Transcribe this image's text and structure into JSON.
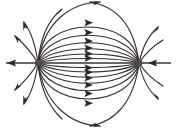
{
  "figure": {
    "background_color": "#ffffff",
    "line_color": "#332f2e",
    "arrow_color": "#2b2827",
    "pole_color": "#504a48",
    "canvas": {
      "width": 176,
      "height": 128
    }
  },
  "poles": [
    {
      "name": "left-pole",
      "label": "",
      "x": 38,
      "y": 63,
      "radius": 3.2
    },
    {
      "name": "right-pole",
      "label": "",
      "x": 139,
      "y": 63,
      "radius": 3.4
    }
  ],
  "axis": {
    "name": "horizontal-axis",
    "y": 63,
    "left_end": 6,
    "right_end": 171,
    "left_arrow_direction": "left",
    "left_arrow_x": 13,
    "right_arrow_direction": "left",
    "right_arrow_x": 148
  },
  "chart_data": {
    "type": "line",
    "xlabel": "",
    "ylabel": "",
    "xlim": [
      0,
      176
    ],
    "ylim": [
      0,
      128
    ],
    "grid": false,
    "legend": "none",
    "series": [
      {
        "name": "inner-loop-1",
        "half_height": 3,
        "arrow_direction": "right",
        "arrow_y": 60
      },
      {
        "name": "inner-loop-2",
        "half_height": 8,
        "arrow_direction": "right",
        "arrow_y": 55
      },
      {
        "name": "inner-loop-3",
        "half_height": 14,
        "arrow_direction": "right",
        "arrow_y": 49
      },
      {
        "name": "inner-loop-4",
        "half_height": 21,
        "arrow_direction": "right",
        "arrow_y": 42
      },
      {
        "name": "inner-loop-5",
        "half_height": 29,
        "arrow_direction": "right",
        "arrow_y": 34
      },
      {
        "name": "inner-loop-6",
        "half_height": 38,
        "arrow_direction": "right",
        "arrow_y": 25
      },
      {
        "name": "outer-escape-upper-left",
        "arrow_direction": "up-right"
      },
      {
        "name": "outer-escape-upper-right",
        "arrow_direction": "down-right"
      },
      {
        "name": "outer-escape-lower-left",
        "arrow_direction": "down-right"
      },
      {
        "name": "outer-escape-lower-right",
        "arrow_direction": "up-right"
      }
    ],
    "radiating_stubs": {
      "left_pole_count": 8,
      "right_pole_count": 4,
      "note": "short arrowed segments radiating away from each pole"
    }
  }
}
